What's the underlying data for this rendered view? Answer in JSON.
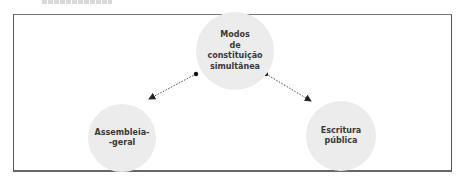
{
  "diagram": {
    "top_fragment": "",
    "nodes": [
      {
        "id": "center",
        "label": "Modos\nde\nconstituição\nsimultânea"
      },
      {
        "id": "left",
        "label": "Assembleia-\n-geral"
      },
      {
        "id": "right",
        "label": "Escritura\npública"
      }
    ],
    "edges": [
      {
        "from": "center",
        "to": "left",
        "style": "dotted-arrow"
      },
      {
        "from": "center",
        "to": "right",
        "style": "dotted-arrow"
      }
    ],
    "colors": {
      "node_fill": "#ececec",
      "frame": "#555555",
      "text": "#3a3a3a",
      "edge": "#222222"
    }
  }
}
